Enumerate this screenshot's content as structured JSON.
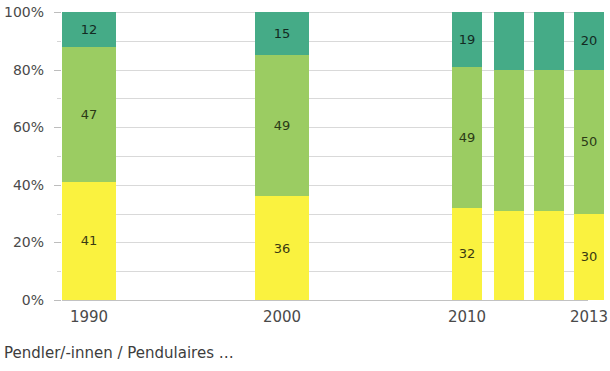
{
  "chart_data": {
    "type": "bar",
    "subtype": "100% stacked column",
    "title": "",
    "subtitle": "",
    "xlabel": "",
    "ylabel": "",
    "ylim": [
      0,
      100
    ],
    "ytick_labels": [
      "0%",
      "20%",
      "40%",
      "60%",
      "80%",
      "100%"
    ],
    "ytick_values": [
      0,
      20,
      40,
      60,
      80,
      100
    ],
    "gridline_values": [
      0,
      10,
      20,
      30,
      40,
      50,
      60,
      70,
      80,
      90,
      100
    ],
    "grid": true,
    "legend": false,
    "categories": [
      "1990",
      "2000",
      "2010",
      "2011",
      "2012",
      "2013"
    ],
    "xtick_labels_shown": [
      "1990",
      "2000",
      "2010",
      "2013"
    ],
    "series": [
      {
        "name": "bottom-yellow",
        "color": "#faf23f",
        "values": [
          41,
          36,
          32,
          31,
          31,
          30
        ],
        "labels": [
          "41",
          "36",
          "32",
          "",
          "",
          "30"
        ]
      },
      {
        "name": "middle-light-green",
        "color": "#9bcc62",
        "values": [
          47,
          49,
          49,
          49,
          49,
          50
        ],
        "labels": [
          "47",
          "49",
          "49",
          "",
          "",
          "50"
        ]
      },
      {
        "name": "top-teal-green",
        "color": "#45ab87",
        "values": [
          12,
          15,
          19,
          20,
          20,
          20
        ],
        "labels": [
          "12",
          "15",
          "19",
          "",
          "",
          "20"
        ]
      }
    ]
  },
  "caption": {
    "text": "Pendler/-innen / Pendulaires …"
  },
  "colors": {
    "top": "#45ab87",
    "middle": "#9bcc62",
    "bottom": "#faf23f",
    "gridline": "#d9d9d9",
    "axis": "#c2c2c2",
    "text": "#4a4a4a",
    "background": "#ffffff"
  }
}
